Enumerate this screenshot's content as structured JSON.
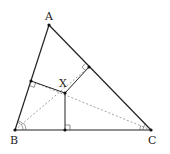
{
  "diagram": {
    "type": "triangle-geometry",
    "points": {
      "A": {
        "label": "A",
        "x": 49,
        "y": 25
      },
      "B": {
        "label": "B",
        "x": 15,
        "y": 130
      },
      "C": {
        "label": "C",
        "x": 151,
        "y": 130
      },
      "X": {
        "label": "X",
        "x": 65,
        "y": 93
      }
    },
    "feet": {
      "on_AB": {
        "x": 31,
        "y": 81
      },
      "on_AC": {
        "x": 89,
        "y": 67
      },
      "on_BC": {
        "x": 65,
        "y": 130
      }
    },
    "segments_solid": [
      "AB",
      "BC",
      "CA",
      "X-footAB",
      "X-footAC",
      "X-footBC"
    ],
    "segments_dashed": [
      "B-X-extended",
      "C-X-extended"
    ],
    "angle_marks": [
      "double arc at B (bisected)",
      "double arc at C (bisected)"
    ],
    "right_angle_marks": [
      "at foot on AB",
      "at foot on AC",
      "at foot on BC"
    ],
    "colors": {
      "stroke": "#222222",
      "dashed": "#888888"
    }
  }
}
